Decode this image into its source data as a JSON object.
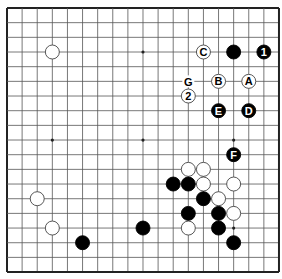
{
  "board": {
    "size": 19,
    "origin_x": 7,
    "origin_y": 8,
    "spacing_x": 15.11,
    "spacing_y": 14.67,
    "stone_radius": 7,
    "colors": {
      "background": "#ffffff",
      "grid": "#555555",
      "border": "#222222",
      "black_stone": "#000000",
      "white_stone": "#ffffff",
      "white_outline": "#444444",
      "label_on_black": "#ffffff",
      "label_on_white": "#000000",
      "label_on_empty": "#000000"
    },
    "star_points": [
      [
        3,
        3
      ],
      [
        9,
        3
      ],
      [
        15,
        3
      ],
      [
        3,
        9
      ],
      [
        9,
        9
      ],
      [
        15,
        9
      ],
      [
        3,
        15
      ],
      [
        9,
        15
      ],
      [
        15,
        15
      ]
    ],
    "stones": [
      {
        "col": 3,
        "row": 3,
        "color": "white",
        "label": ""
      },
      {
        "col": 13,
        "row": 3,
        "color": "white",
        "label": "C"
      },
      {
        "col": 15,
        "row": 3,
        "color": "black",
        "label": ""
      },
      {
        "col": 17,
        "row": 3,
        "color": "black",
        "label": "1"
      },
      {
        "col": 14,
        "row": 5,
        "color": "white",
        "label": "B"
      },
      {
        "col": 16,
        "row": 5,
        "color": "white",
        "label": "A"
      },
      {
        "col": 12,
        "row": 6,
        "color": "white",
        "label": "2"
      },
      {
        "col": 14,
        "row": 7,
        "color": "black",
        "label": "E"
      },
      {
        "col": 16,
        "row": 7,
        "color": "black",
        "label": "D"
      },
      {
        "col": 15,
        "row": 10,
        "color": "black",
        "label": "F"
      },
      {
        "col": 12,
        "row": 11,
        "color": "white",
        "label": ""
      },
      {
        "col": 13,
        "row": 11,
        "color": "white",
        "label": ""
      },
      {
        "col": 11,
        "row": 12,
        "color": "black",
        "label": ""
      },
      {
        "col": 12,
        "row": 12,
        "color": "black",
        "label": ""
      },
      {
        "col": 13,
        "row": 12,
        "color": "white",
        "label": ""
      },
      {
        "col": 15,
        "row": 12,
        "color": "white",
        "label": ""
      },
      {
        "col": 2,
        "row": 13,
        "color": "white",
        "label": ""
      },
      {
        "col": 13,
        "row": 13,
        "color": "black",
        "label": ""
      },
      {
        "col": 14,
        "row": 13,
        "color": "white",
        "label": ""
      },
      {
        "col": 12,
        "row": 14,
        "color": "black",
        "label": ""
      },
      {
        "col": 14,
        "row": 14,
        "color": "black",
        "label": ""
      },
      {
        "col": 15,
        "row": 14,
        "color": "white",
        "label": ""
      },
      {
        "col": 3,
        "row": 15,
        "color": "white",
        "label": ""
      },
      {
        "col": 9,
        "row": 15,
        "color": "black",
        "label": ""
      },
      {
        "col": 12,
        "row": 15,
        "color": "white",
        "label": ""
      },
      {
        "col": 14,
        "row": 15,
        "color": "black",
        "label": ""
      },
      {
        "col": 5,
        "row": 16,
        "color": "black",
        "label": ""
      },
      {
        "col": 15,
        "row": 16,
        "color": "black",
        "label": ""
      }
    ],
    "empty_labels": [
      {
        "col": 12,
        "row": 5,
        "label": "G"
      }
    ]
  }
}
